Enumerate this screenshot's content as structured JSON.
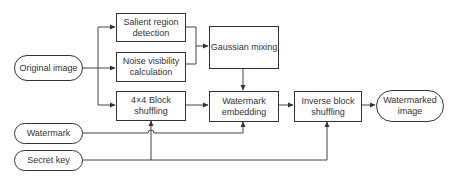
{
  "diagram": {
    "title": "",
    "nodes": [
      {
        "id": "original",
        "label": "Original image",
        "shape": "terminal"
      },
      {
        "id": "watermark",
        "label": "Watermark",
        "shape": "terminal"
      },
      {
        "id": "secretkey",
        "label": "Secret key",
        "shape": "terminal"
      },
      {
        "id": "salient",
        "label": "Salient region detection",
        "shape": "process"
      },
      {
        "id": "noise",
        "label": "Noise visibility calculation",
        "shape": "process"
      },
      {
        "id": "shuffle",
        "label": "4×4 Block shuffling",
        "shape": "process"
      },
      {
        "id": "gaussian",
        "label": "Gaussian mixing",
        "shape": "process"
      },
      {
        "id": "embed",
        "label": "Watermark embedding",
        "shape": "process"
      },
      {
        "id": "inverse",
        "label": "Inverse block shuffling",
        "shape": "process"
      },
      {
        "id": "output",
        "label": "Watermarked image",
        "shape": "terminal"
      }
    ],
    "edges": [
      {
        "from": "original",
        "to": "salient"
      },
      {
        "from": "original",
        "to": "noise"
      },
      {
        "from": "original",
        "to": "shuffle"
      },
      {
        "from": "salient",
        "to": "gaussian"
      },
      {
        "from": "noise",
        "to": "gaussian"
      },
      {
        "from": "gaussian",
        "to": "embed"
      },
      {
        "from": "shuffle",
        "to": "embed"
      },
      {
        "from": "watermark",
        "to": "embed"
      },
      {
        "from": "secretkey",
        "to": "shuffle"
      },
      {
        "from": "secretkey",
        "to": "inverse"
      },
      {
        "from": "embed",
        "to": "inverse"
      },
      {
        "from": "inverse",
        "to": "output"
      }
    ]
  },
  "labels": {
    "original": "Original image",
    "watermark": "Watermark",
    "secretkey": "Secret key",
    "salient_l1": "Salient region",
    "salient_l2": "detection",
    "noise_l1": "Noise visibility",
    "noise_l2": "calculation",
    "shuffle_l1": "4×4 Block",
    "shuffle_l2": "shuffling",
    "gaussian": "Gaussian mixing",
    "embed_l1": "Watermark",
    "embed_l2": "embedding",
    "inverse_l1": "Inverse block",
    "inverse_l2": "shuffling",
    "output_l1": "Watermarked",
    "output_l2": "image"
  },
  "colors": {
    "stroke": "#333333",
    "background": "#ffffff",
    "text": "#333333"
  }
}
